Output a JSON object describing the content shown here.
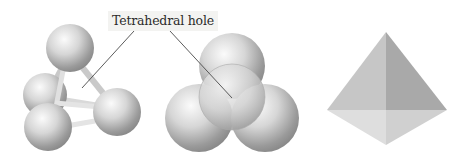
{
  "figure": {
    "label": "Tetrahedral hole",
    "panels": [
      {
        "name": "ball-and-stick model",
        "spheres": 4
      },
      {
        "name": "space-filling model",
        "spheres": 4
      },
      {
        "name": "tetrahedron",
        "shape": "triangular pyramid"
      }
    ],
    "colors": {
      "sphere_light": "#f2f2f2",
      "sphere_dark": "#8e8e8e",
      "stick": "#d8d8d8",
      "leader_line": "#4a4a4a",
      "face_left": "#c4c4c4",
      "face_right": "#a8a8a8",
      "face_bottom_left": "#dcdcdc",
      "face_bottom_right": "#cfcfcf"
    }
  }
}
